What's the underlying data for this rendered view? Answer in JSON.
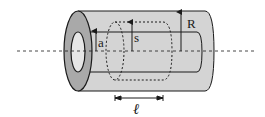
{
  "figure": {
    "labels": {
      "inner_radius": "a",
      "gaussian_radius": "s",
      "outer_radius": "R",
      "length": "ℓ"
    },
    "colors": {
      "shell_fill": "#d4d4d4",
      "end_face_fill": "#a9a9a9",
      "hole_fill": "#e6e6e6",
      "stroke": "#1a1a1a",
      "background": "#ffffff"
    }
  }
}
